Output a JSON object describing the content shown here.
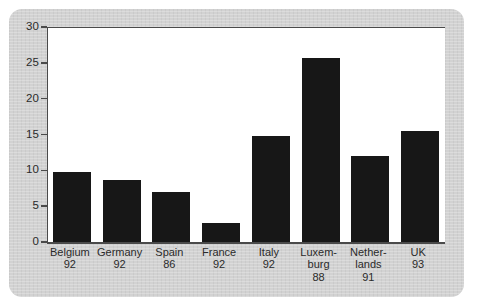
{
  "chart": {
    "title": "",
    "background_color": "#d2d2d2",
    "plot_background_color": "#ffffff",
    "bar_color": "#171717",
    "axis_color": "#4a4a4a"
  },
  "chart_data": {
    "type": "bar",
    "title": "",
    "subtitle": "",
    "xlabel": "",
    "ylabel": "",
    "categories": [
      "Belgium\n92",
      "Germany\n92",
      "Spain\n86",
      "France\n92",
      "Italy\n92",
      "Luxem-\nburg\n88",
      "Nether-\nlands\n91",
      "UK\n93"
    ],
    "category_names": [
      "Belgium",
      "Germany",
      "Spain",
      "France",
      "Italy",
      "Luxembourg",
      "Netherlands",
      "UK"
    ],
    "category_years": [
      "92",
      "92",
      "86",
      "92",
      "92",
      "88",
      "91",
      "93"
    ],
    "values": [
      9.8,
      8.7,
      7.0,
      2.7,
      14.8,
      25.7,
      12.0,
      15.5
    ],
    "ylim": [
      0,
      30
    ],
    "yticks": [
      0,
      5,
      10,
      15,
      20,
      25,
      30
    ],
    "ytick_labels": [
      "0",
      "5",
      "10",
      "15",
      "20",
      "25",
      "30"
    ],
    "grid": false,
    "legend": null,
    "legend_position": "none",
    "bar_color": "#171717",
    "annotations": []
  }
}
